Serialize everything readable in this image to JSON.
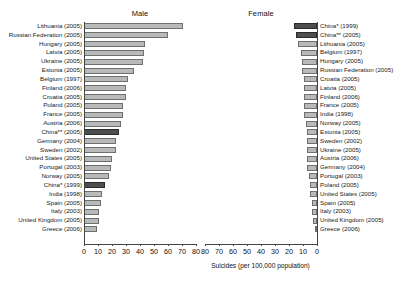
{
  "chart_data": {
    "type": "bar",
    "title": "",
    "xlabel": "Suicides (per 100,000 population)",
    "ylabel": "",
    "orientation": "horizontal",
    "layout": "back-to-back mirrored panels",
    "grid": false,
    "legend": "none",
    "panels": [
      {
        "name": "male",
        "title": "Male",
        "axis_direction": "left-to-right",
        "xlim": [
          0,
          80
        ],
        "xticks": [
          0,
          10,
          20,
          30,
          40,
          50,
          60,
          70,
          80
        ],
        "categories": [
          "Lithuania (2005)",
          "Russian Federation (2005)",
          "Hungary (2005)",
          "Latvia (2005)",
          "Ukraine (2005)",
          "Estonia (2005)",
          "Belgium (1997)",
          "Finland (2006)",
          "Croatia (2005)",
          "Poland (2005)",
          "France (2005)",
          "Austria (2006)",
          "China** (2005)",
          "Germany (2004)",
          "Sweden (2002)",
          "United States (2005)",
          "Portugal (2003)",
          "Norway (2005)",
          "China* (1999)",
          "India (1998)",
          "Spain (2005)",
          "Italy (2003)",
          "United Kingdom (2005)",
          "Greece (2006)"
        ],
        "values": [
          71.0,
          60.0,
          43.5,
          43.0,
          42.0,
          35.5,
          31.5,
          30.0,
          30.0,
          28.0,
          27.5,
          26.5,
          25.0,
          23.0,
          23.0,
          20.0,
          19.0,
          18.0,
          15.0,
          12.5,
          12.0,
          11.0,
          10.5,
          9.5
        ],
        "highlighted": [
          "China** (2005)",
          "China* (1999)"
        ]
      },
      {
        "name": "female",
        "title": "Female",
        "axis_direction": "right-to-left",
        "xlim": [
          80,
          0
        ],
        "xticks": [
          80,
          70,
          60,
          50,
          40,
          30,
          20,
          10,
          0
        ],
        "categories": [
          "China* (1999)",
          "China** (2005)",
          "Lithuania (2005)",
          "Belgium (1997)",
          "Hungary (2005)",
          "Russian Federation (2005)",
          "Croatia (2005)",
          "Latvia (2005)",
          "Finland (2006)",
          "France (2005)",
          "India (1998)",
          "Norway (2005)",
          "Estonia (2005)",
          "Sweden (2002)",
          "Ukraine (2005)",
          "Austria (2006)",
          "Germany (2004)",
          "Portugal (2003)",
          "Poland (2005)",
          "United States (2005)",
          "Spain (2005)",
          "Italy (2003)",
          "United Kingdom (2005)",
          "Greece (2006)"
        ],
        "values": [
          16.5,
          15.0,
          13.5,
          11.5,
          11.0,
          10.5,
          9.5,
          9.0,
          9.0,
          9.0,
          9.0,
          8.0,
          7.5,
          7.5,
          7.0,
          7.0,
          7.0,
          5.5,
          5.0,
          5.0,
          3.5,
          3.5,
          3.0,
          1.5
        ],
        "highlighted": [
          "China* (1999)",
          "China** (2005)"
        ]
      }
    ],
    "colors": {
      "bar_fill": "#b9b9b9",
      "bar_edge": "#6f6f6f",
      "highlight_fill": "#4e4e4e",
      "highlight_edge": "#2b2b2b",
      "axis": "#444444",
      "text": "#1a1a1a"
    }
  }
}
